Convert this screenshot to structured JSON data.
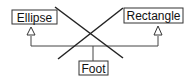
{
  "diagram": {
    "type": "uml-class-inheritance-crossed-out",
    "classes": [
      {
        "id": "ellipse",
        "label": "Ellipse"
      },
      {
        "id": "rectangle",
        "label": "Rectangle"
      },
      {
        "id": "foot",
        "label": "Foot"
      }
    ],
    "relations": [
      {
        "from": "foot",
        "to": "ellipse",
        "kind": "generalization"
      },
      {
        "from": "foot",
        "to": "rectangle",
        "kind": "generalization"
      }
    ],
    "annotation": "large X crossing out the inheritance",
    "colors": {
      "stroke": "#222222",
      "box_fill": "#ffffff",
      "background": "#ffffff"
    }
  }
}
